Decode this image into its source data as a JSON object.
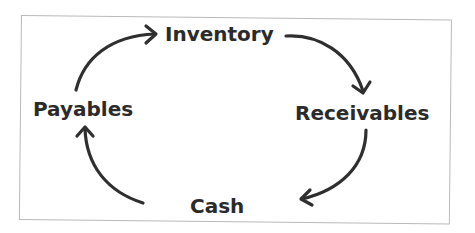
{
  "diagram": {
    "type": "cycle",
    "nodes": [
      {
        "id": "inventory",
        "label": "Inventory"
      },
      {
        "id": "receivables",
        "label": "Receivables"
      },
      {
        "id": "cash",
        "label": "Cash"
      },
      {
        "id": "payables",
        "label": "Payables"
      }
    ],
    "edges": [
      {
        "from": "payables",
        "to": "inventory"
      },
      {
        "from": "inventory",
        "to": "receivables"
      },
      {
        "from": "receivables",
        "to": "cash"
      },
      {
        "from": "cash",
        "to": "payables"
      }
    ],
    "colors": {
      "text": "#2b2b2b",
      "arrow": "#2f2f2f",
      "border": "#b9b9b9",
      "background": "#ffffff"
    }
  }
}
